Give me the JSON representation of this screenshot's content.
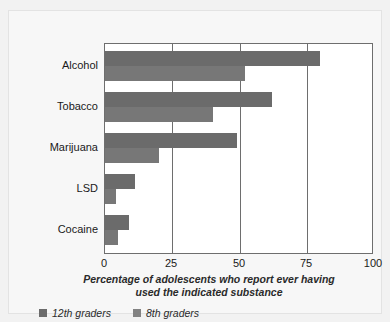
{
  "chart_data": {
    "type": "bar",
    "orientation": "horizontal",
    "title": "",
    "xlabel": "Percentage of adolescents who report ever having used the indicated substance",
    "ylabel": "",
    "xlim": [
      0,
      100
    ],
    "xticks": [
      0,
      25,
      50,
      75,
      100
    ],
    "xtick_labels": [
      "0",
      "25",
      "50",
      "75",
      "100"
    ],
    "grid": true,
    "grid_axis": "x",
    "legend_position": "bottom-left",
    "categories": [
      "Alcohol",
      "Tobacco",
      "Marijuana",
      "LSD",
      "Cocaine"
    ],
    "series": [
      {
        "name": "12th graders",
        "color": "#6b6b6b",
        "values": [
          80,
          62,
          49,
          11,
          9
        ]
      },
      {
        "name": "8th graders",
        "color": "#777777",
        "values": [
          52,
          40,
          20,
          4,
          5
        ]
      }
    ]
  },
  "caption": {
    "line1": "Percentage of adolescents who report ever having",
    "line2": "used the indicated substance"
  },
  "colors": {
    "series_12th": "#6b6b6b",
    "series_8th": "#777777",
    "axis": "#6e6e6e",
    "background": "#f7f7f7",
    "plot_background": "#ffffff"
  }
}
